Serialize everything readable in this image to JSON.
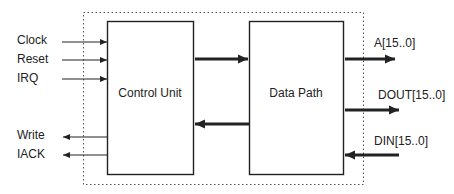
{
  "diagram": {
    "type": "block-diagram",
    "blocks": [
      {
        "id": "control-unit",
        "label": "Control Unit"
      },
      {
        "id": "data-path",
        "label": "Data Path"
      }
    ],
    "inputs": [
      {
        "label": "Clock",
        "direction": "in",
        "target": "control-unit"
      },
      {
        "label": "Reset",
        "direction": "in",
        "target": "control-unit"
      },
      {
        "label": "IRQ",
        "direction": "in",
        "target": "control-unit"
      }
    ],
    "outputs_left": [
      {
        "label": "Write",
        "direction": "out",
        "source": "control-unit"
      },
      {
        "label": "IACK",
        "direction": "out",
        "source": "control-unit"
      }
    ],
    "right_signals": [
      {
        "label": "A[15..0]",
        "direction": "out",
        "source": "data-path"
      },
      {
        "label": "DOUT[15..0]",
        "direction": "out",
        "source": "data-path"
      },
      {
        "label": "DIN[15..0]",
        "direction": "in",
        "target": "data-path"
      }
    ],
    "internal_connections": [
      {
        "from": "control-unit",
        "to": "data-path"
      },
      {
        "from": "data-path",
        "to": "control-unit"
      }
    ],
    "boundary": "dotted",
    "colors": {
      "line": "#222222",
      "boundary": "#555555",
      "background": "#ffffff"
    }
  }
}
